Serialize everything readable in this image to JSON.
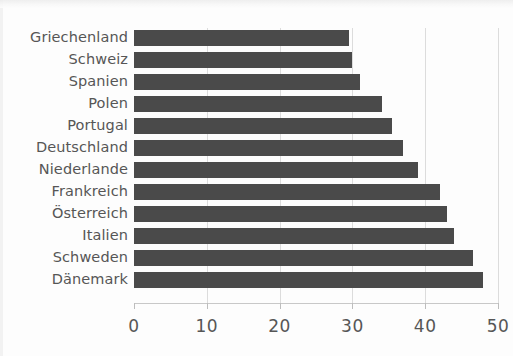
{
  "chart_data": {
    "type": "bar",
    "orientation": "horizontal",
    "title": "",
    "subtitle": "",
    "xlabel": "",
    "ylabel": "",
    "categories": [
      "Griechenland",
      "Schweiz",
      "Spanien",
      "Polen",
      "Portugal",
      "Deutschland",
      "Niederlande",
      "Frankreich",
      "Österreich",
      "Italien",
      "Schweden",
      "Dänemark"
    ],
    "values": [
      29.5,
      30,
      31,
      34,
      35.5,
      37,
      39,
      42,
      43,
      44,
      46.5,
      48
    ],
    "xlim": [
      0,
      50
    ],
    "xticks": [
      0,
      10,
      20,
      30,
      40,
      50
    ],
    "xtick_labels": [
      "0",
      "10",
      "20",
      "30",
      "40",
      "50"
    ],
    "grid": true,
    "grid_axis": "x",
    "legend": false,
    "legend_position": "none",
    "bar_color": "#4a4a4a",
    "gridline_color": "#dcdcdc",
    "axis_color": "#c8c8c8",
    "label_color": "#565656",
    "background_color": "#fdfdfd"
  }
}
